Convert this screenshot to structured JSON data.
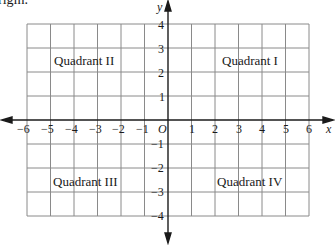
{
  "header_fragment": "rigin.",
  "diagram": {
    "x_axis": {
      "label": "x",
      "ticks": [
        "−6",
        "−5",
        "−4",
        "−3",
        "−2",
        "−1",
        "1",
        "2",
        "3",
        "4",
        "5",
        "6"
      ],
      "range": [
        -6,
        6
      ]
    },
    "y_axis": {
      "label": "y",
      "ticks": [
        "4",
        "3",
        "2",
        "1",
        "−1",
        "−2",
        "−3",
        "−4"
      ],
      "range": [
        -4,
        4
      ]
    },
    "origin_label": "O",
    "quadrants": {
      "q1": "Quadrant I",
      "q2": "Quadrant II",
      "q3": "Quadrant III",
      "q4": "Quadrant IV"
    },
    "colors": {
      "grid": "#8a8a8a",
      "axis": "#1a1a1a",
      "text": "#1a1a1a"
    }
  }
}
